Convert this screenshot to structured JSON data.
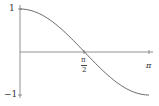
{
  "chart_data": {
    "type": "line",
    "title": "",
    "xlabel": "",
    "ylabel": "",
    "function": "cos(x)",
    "x": [
      0,
      0.3927,
      0.7854,
      1.1781,
      1.5708,
      1.9635,
      2.3562,
      2.7489,
      3.1416
    ],
    "series": [
      {
        "name": "cos(x)",
        "values": [
          1,
          0.9239,
          0.7071,
          0.3827,
          0,
          -0.3827,
          -0.7071,
          -0.9239,
          -1
        ]
      }
    ],
    "xlim": [
      0,
      3.1416
    ],
    "ylim": [
      -1,
      1
    ],
    "x_ticks": [
      {
        "value": 1.5708,
        "label": "π/2"
      },
      {
        "value": 3.1416,
        "label": "π"
      }
    ],
    "y_ticks": [
      {
        "value": 1,
        "label": "1"
      },
      {
        "value": -1,
        "label": "-1"
      }
    ],
    "grid": false,
    "legend": "none"
  },
  "labels": {
    "y_top": "1",
    "y_bottom": "−1",
    "x_half_num": "π",
    "x_half_den": "2",
    "x_pi": "π"
  },
  "colors": {
    "axis": "#555555",
    "curve": "#555555"
  }
}
